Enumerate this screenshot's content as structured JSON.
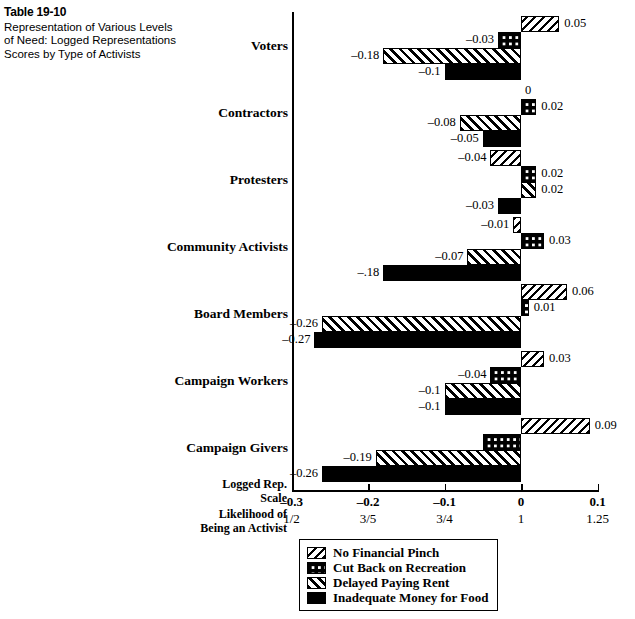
{
  "caption": {
    "table_number": "Table 19-10",
    "description": "Representation of Various Levels of Need: Logged Representations Scores by Type of Activists"
  },
  "axis": {
    "name_line1": "Logged Rep.",
    "name_line2": "Scale",
    "name_line3": "Likelihood of",
    "name_line4": "Being an Activist",
    "ticks": [
      "-0.3",
      "-0.2",
      "-0.1",
      "0",
      "0.1"
    ],
    "ticks2": [
      "1/2",
      "3/5",
      "3/4",
      "1",
      "1.25"
    ]
  },
  "legend": {
    "items": [
      {
        "label": "No Financial Pinch",
        "pattern": "p-nofin"
      },
      {
        "label": "Cut Back on Recreation",
        "pattern": "p-recr"
      },
      {
        "label": "Delayed Paying Rent",
        "pattern": "p-rent"
      },
      {
        "label": "Inadequate Money for Food",
        "pattern": "p-food"
      }
    ]
  },
  "chart_data": {
    "type": "bar",
    "orientation": "horizontal",
    "title": "Representation of Various Levels of Need: Logged Representations Scores by Type of Activists",
    "xlabel": "Logged Rep. Scale",
    "ylabel": "",
    "xlim": [
      -0.3,
      0.1
    ],
    "xticks": [
      -0.3,
      -0.2,
      -0.1,
      0,
      0.1
    ],
    "xticklabels": [
      "-0.3",
      "-0.2",
      "-0.1",
      "0",
      "0.1"
    ],
    "secondary_xticklabels": [
      "1/2",
      "3/5",
      "3/4",
      "1",
      "1.25"
    ],
    "secondary_xlabel": "Likelihood of Being an Activist",
    "grid": false,
    "legend_position": "bottom",
    "categories": [
      "Voters",
      "Contractors",
      "Protesters",
      "Community Activists",
      "Board Members",
      "Campaign Workers",
      "Campaign Givers"
    ],
    "series": [
      {
        "name": "No Financial Pinch",
        "values": [
          0.05,
          0,
          -0.04,
          -0.01,
          0.06,
          0.03,
          0.09
        ],
        "labels": [
          "0.05",
          "0",
          "–0.04",
          "–0.01",
          "0.06",
          "0.03",
          "0.09"
        ]
      },
      {
        "name": "Cut Back on Recreation",
        "values": [
          -0.03,
          0.02,
          0.02,
          0.03,
          0.01,
          -0.04,
          -0.05
        ],
        "labels": [
          "–0.03",
          "0.02",
          "0.02",
          "0.03",
          "0.01",
          "–0.04",
          ""
        ]
      },
      {
        "name": "Delayed Paying Rent",
        "values": [
          -0.18,
          -0.08,
          0.02,
          -0.07,
          -0.26,
          -0.1,
          -0.19
        ],
        "labels": [
          "–0.18",
          "–0.08",
          "0.02",
          "–0.07",
          "–0.26",
          "–0.1",
          "–0.19"
        ]
      },
      {
        "name": "Inadequate Money for Food",
        "values": [
          -0.1,
          -0.05,
          -0.03,
          -0.18,
          -0.27,
          -0.1,
          -0.26
        ],
        "labels": [
          "–0.1",
          "–0.05",
          "–0.03",
          "–.18",
          "–0.27",
          "–0.1",
          "–0.26"
        ]
      }
    ]
  }
}
